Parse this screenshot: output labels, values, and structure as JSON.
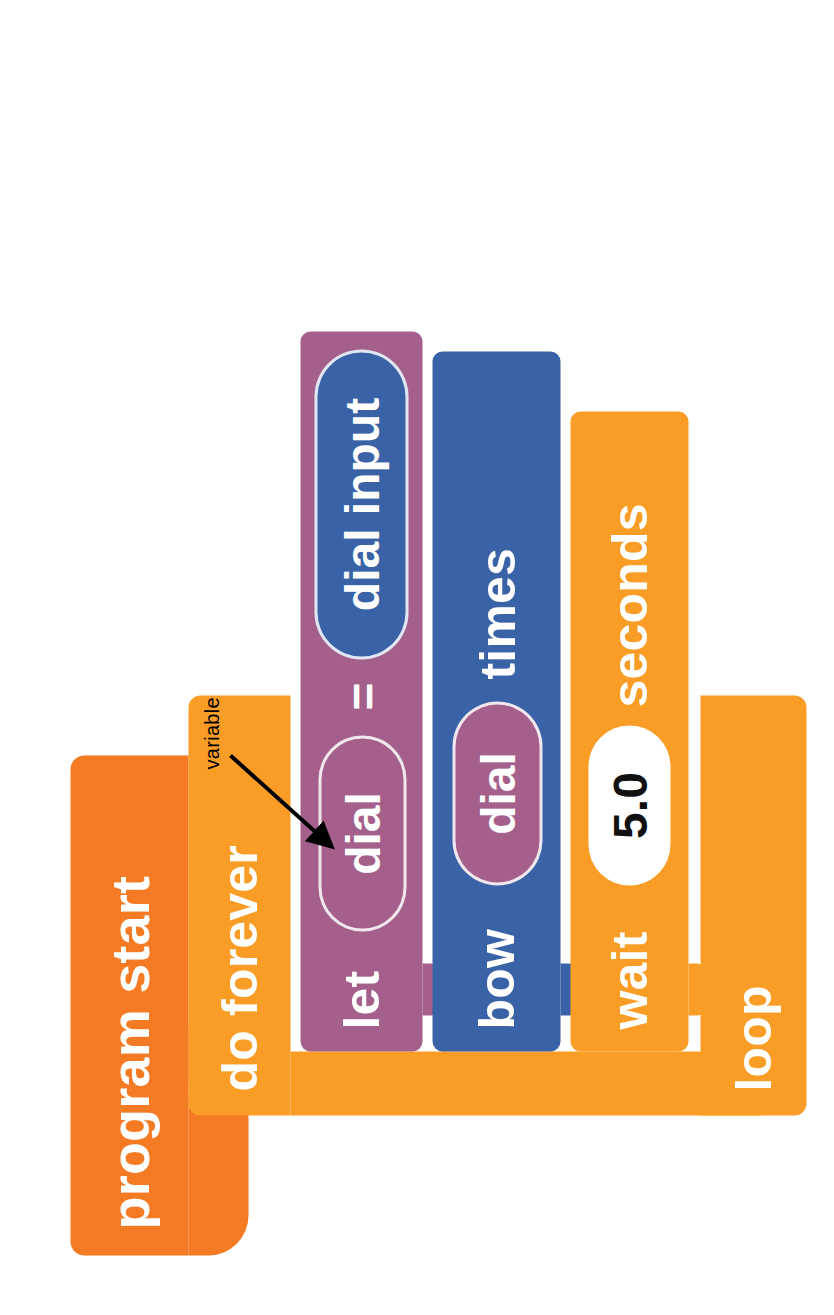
{
  "diagram": {
    "annotation": {
      "label": "variable",
      "points_to": "dial"
    },
    "palette": {
      "hat_orange": "#F47B23",
      "loop_orange": "#F99D27",
      "variable_purple": "#A4608B",
      "action_blue": "#3A62A6",
      "number_field_white": "#FFFFFF",
      "text_white": "#FFFFFF",
      "annotation_black": "#000000",
      "background": "#FFFFFF"
    },
    "blocks": [
      {
        "id": "program-start",
        "kind": "hat",
        "color": "hat_orange",
        "label": "program start"
      },
      {
        "id": "do-forever",
        "kind": "c-block-top",
        "color": "loop_orange",
        "label": "do forever"
      },
      {
        "id": "let-dial",
        "kind": "statement",
        "color": "variable_purple",
        "label": "let",
        "operator": "=",
        "slot_variable": "dial",
        "slot_value": "dial input"
      },
      {
        "id": "bow-times",
        "kind": "statement",
        "color": "action_blue",
        "label": "bow",
        "slot_variable": "dial",
        "trailing_label": "times"
      },
      {
        "id": "wait-seconds",
        "kind": "statement",
        "color": "loop_orange",
        "label": "wait",
        "value": "5.0",
        "trailing_label": "seconds"
      },
      {
        "id": "loop-end",
        "kind": "c-block-bottom",
        "color": "loop_orange",
        "label": "loop"
      }
    ]
  }
}
